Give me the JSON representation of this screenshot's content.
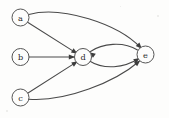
{
  "figure": {
    "kind": "directed-graph",
    "background_color": "#fdfdfc",
    "node_stroke_color": "#555555",
    "edge_color": "#4a4a4a",
    "label_color": "#2b2b2b",
    "width": 169,
    "height": 118
  },
  "nodes": [
    {
      "id": "a",
      "label": "a",
      "cx": 20.5,
      "cy": 17.5,
      "r": 8.5
    },
    {
      "id": "b",
      "label": "b",
      "cx": 20.5,
      "cy": 57.0,
      "r": 8.5
    },
    {
      "id": "c",
      "label": "c",
      "cx": 20.5,
      "cy": 97.5,
      "r": 8.5
    },
    {
      "id": "d",
      "label": "d",
      "cx": 83.0,
      "cy": 57.0,
      "r": 8.5
    },
    {
      "id": "e",
      "label": "e",
      "cx": 145.5,
      "cy": 54.5,
      "r": 8.5
    }
  ],
  "edges": [
    {
      "id": "a-d",
      "from": "a",
      "to": "d",
      "shape": "straight"
    },
    {
      "id": "a-e",
      "from": "a",
      "to": "e",
      "shape": "curve-up"
    },
    {
      "id": "b-d",
      "from": "b",
      "to": "d",
      "shape": "straight"
    },
    {
      "id": "c-d",
      "from": "c",
      "to": "d",
      "shape": "straight"
    },
    {
      "id": "c-e",
      "from": "c",
      "to": "e",
      "shape": "curve-up"
    },
    {
      "id": "d-e",
      "from": "d",
      "to": "e",
      "shape": "curve-down"
    },
    {
      "id": "e-d",
      "from": "e",
      "to": "d",
      "shape": "curve-up"
    }
  ],
  "geometry": {
    "paths": {
      "a-d": "M 27.6 22.2 L 75.6 52.6",
      "a-e": "M 28.8 14.4 C 62 5.5 118 24 140.5 47.5",
      "b-d": "M 29.0 57.0 L 74.5 57.0",
      "c-d": "M 28.0 93.0 L 76.0 62.4",
      "c-e": "M 28.5 99.2 C 66 102 115 82 139.0 61.5",
      "d-e": "M 89.5 61.0 C 104 70 124 68 138.5 58.8",
      "e-d": "M 137.5 50.0 C 123 41 102 43.5 90.5 51.5"
    },
    "arrows": {
      "a-d": {
        "x": 77.5,
        "y": 53.8,
        "angle": 32.4
      },
      "a-e": {
        "x": 141.8,
        "y": 48.8,
        "angle": 47.0
      },
      "b-d": {
        "x": 75.0,
        "y": 57.0,
        "angle": 0
      },
      "c-d": {
        "x": 77.8,
        "y": 61.2,
        "angle": -32.5
      },
      "c-e": {
        "x": 140.2,
        "y": 60.4,
        "angle": -41.0
      },
      "d-e": {
        "x": 139.8,
        "y": 58.0,
        "angle": -32.0
      },
      "e-d": {
        "x": 89.3,
        "y": 52.2,
        "angle": 215.0
      }
    }
  },
  "specks": [
    {
      "x": 157,
      "y": 15,
      "w": 2,
      "h": 2
    },
    {
      "x": 6,
      "y": 110,
      "w": 2,
      "h": 2
    },
    {
      "x": 120,
      "y": 6,
      "w": 1,
      "h": 1
    }
  ]
}
